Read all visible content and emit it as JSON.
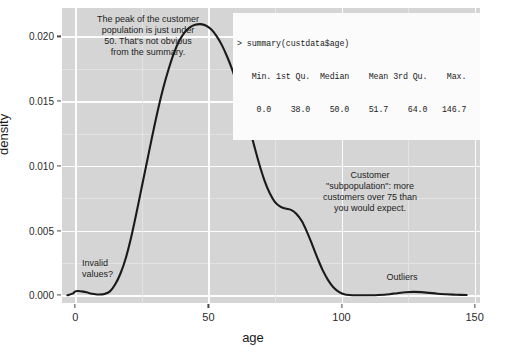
{
  "chart_data": {
    "type": "line",
    "title": "",
    "xlabel": "age",
    "ylabel": "density",
    "xlim": [
      -5,
      152
    ],
    "ylim": [
      -0.0006,
      0.0222
    ],
    "grid": true,
    "legend_position": "none",
    "series": [
      {
        "name": "age density",
        "points": [
          [
            -3,
            0.0
          ],
          [
            -1,
            0.00012
          ],
          [
            0,
            0.0003
          ],
          [
            1,
            0.00033
          ],
          [
            3,
            0.00028
          ],
          [
            5,
            0.00018
          ],
          [
            7,
            0.0001
          ],
          [
            9,
            6e-05
          ],
          [
            11,
            0.0001
          ],
          [
            13,
            0.0003
          ],
          [
            15,
            0.00085
          ],
          [
            17,
            0.0017
          ],
          [
            19,
            0.0029
          ],
          [
            21,
            0.0045
          ],
          [
            23,
            0.0064
          ],
          [
            25,
            0.0084
          ],
          [
            27,
            0.0104
          ],
          [
            29,
            0.0124
          ],
          [
            31,
            0.0143
          ],
          [
            33,
            0.016
          ],
          [
            35,
            0.01745
          ],
          [
            37,
            0.0187
          ],
          [
            39,
            0.01965
          ],
          [
            41,
            0.0203
          ],
          [
            43,
            0.0207
          ],
          [
            45,
            0.0209
          ],
          [
            47,
            0.02095
          ],
          [
            49,
            0.02085
          ],
          [
            51,
            0.02055
          ],
          [
            53,
            0.02005
          ],
          [
            55,
            0.01935
          ],
          [
            57,
            0.01845
          ],
          [
            59,
            0.0174
          ],
          [
            61,
            0.01615
          ],
          [
            63,
            0.01475
          ],
          [
            65,
            0.01325
          ],
          [
            67,
            0.0117
          ],
          [
            69,
            0.0102
          ],
          [
            71,
            0.0089
          ],
          [
            73,
            0.0079
          ],
          [
            75,
            0.0072
          ],
          [
            77,
            0.00685
          ],
          [
            79,
            0.0067
          ],
          [
            81,
            0.0066
          ],
          [
            83,
            0.0063
          ],
          [
            85,
            0.00575
          ],
          [
            87,
            0.0049
          ],
          [
            89,
            0.0039
          ],
          [
            91,
            0.00285
          ],
          [
            93,
            0.0019
          ],
          [
            95,
            0.00115
          ],
          [
            97,
            0.0006
          ],
          [
            99,
            0.00026
          ],
          [
            101,
            8e-05
          ],
          [
            103,
            2e-05
          ],
          [
            106,
            0.0
          ],
          [
            110,
            0.0
          ],
          [
            114,
            2e-05
          ],
          [
            118,
            8e-05
          ],
          [
            121,
            0.00016
          ],
          [
            124,
            0.00023
          ],
          [
            127,
            0.00026
          ],
          [
            130,
            0.00024
          ],
          [
            133,
            0.00018
          ],
          [
            136,
            0.00012
          ],
          [
            139,
            8e-05
          ],
          [
            142,
            5e-05
          ],
          [
            145,
            3e-05
          ],
          [
            147,
            2e-05
          ]
        ]
      }
    ],
    "x_ticks": [
      0,
      50,
      100,
      150
    ],
    "x_tick_labels": [
      "0",
      "50",
      "100",
      "150"
    ],
    "y_ticks": [
      0.0,
      0.005,
      0.01,
      0.015,
      0.02
    ],
    "y_tick_labels": [
      "0.000",
      "0.005",
      "0.010",
      "0.015",
      "0.020"
    ],
    "annotations": [
      {
        "name": "peak-annotation",
        "text": "The peak of the customer\npopulation is just under\n50. That's not obvious\nfrom the summary."
      },
      {
        "name": "summary-advantage-annotation",
        "text": "It's easier to read the mean, median\nand central 50% of the customer\npopulation off the summary."
      },
      {
        "name": "graph-advantage-annotation",
        "text": "It's easier to get a sense of the\ncustomer age range from the graph."
      },
      {
        "name": "subpopulation-annotation",
        "text": "Customer\n\"subpopulation\": more\ncustomers over 75 than\nyou would expect."
      },
      {
        "name": "invalid-values-annotation",
        "text": "Invalid\nvalues?"
      },
      {
        "name": "outliers-annotation",
        "text": "Outliers"
      }
    ]
  },
  "summary_box": {
    "command": "> summary(custdata$age)",
    "header_row": "   Min. 1st Qu.  Median    Mean 3rd Qu.    Max.",
    "value_row": "    0.0    38.0    50.0    51.7    64.0   146.7",
    "columns": [
      "Min.",
      "1st Qu.",
      "Median",
      "Mean",
      "3rd Qu.",
      "Max."
    ],
    "values": [
      "0.0",
      "38.0",
      "50.0",
      "51.7",
      "64.0",
      "146.7"
    ]
  },
  "colors": {
    "panel_background": "#d5d5d5",
    "grid_major": "#fdfdfd",
    "grid_minor": "#e3e3e3",
    "curve": "#1a1a1a",
    "summary_background": "#fbfbfb",
    "text": "#1c1c1c"
  }
}
